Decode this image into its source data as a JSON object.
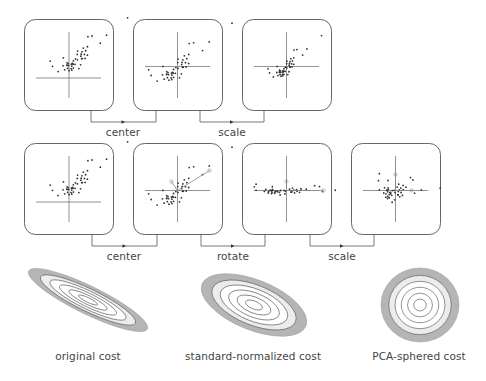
{
  "figure": {
    "rows": [
      {
        "name": "standard-normalization-pipeline",
        "panels": [
          {
            "id": "original",
            "x": 24,
            "y": 19,
            "w": 89,
            "h": 91
          },
          {
            "id": "centered",
            "x": 133,
            "y": 19,
            "w": 89,
            "h": 91
          },
          {
            "id": "scaled",
            "x": 242,
            "y": 19,
            "w": 89,
            "h": 91
          }
        ],
        "steps": [
          {
            "label": "center",
            "x1": 91,
            "x2": 156,
            "y_top": 110,
            "y": 122,
            "label_y": 127
          },
          {
            "label": "scale",
            "x1": 200,
            "x2": 264,
            "y_top": 110,
            "y": 122,
            "label_y": 127
          }
        ]
      },
      {
        "name": "pca-sphering-pipeline",
        "panels": [
          {
            "id": "original",
            "x": 24,
            "y": 143,
            "w": 89,
            "h": 91
          },
          {
            "id": "centered-with-principal-axes",
            "x": 133,
            "y": 143,
            "w": 89,
            "h": 91
          },
          {
            "id": "rotated",
            "x": 242,
            "y": 143,
            "w": 89,
            "h": 91
          },
          {
            "id": "sphered",
            "x": 351,
            "y": 143,
            "w": 89,
            "h": 91
          }
        ],
        "steps": [
          {
            "label": "center",
            "x1": 92,
            "x2": 157,
            "y_top": 234,
            "y": 246,
            "label_y": 251
          },
          {
            "label": "rotate",
            "x1": 201,
            "x2": 265,
            "y_top": 234,
            "y": 246,
            "label_y": 251
          },
          {
            "label": "scale",
            "x1": 310,
            "x2": 374,
            "y_top": 234,
            "y": 246,
            "label_y": 251
          }
        ]
      }
    ],
    "cost_plots": [
      {
        "label": "original cost",
        "cx": 88,
        "cy": 300,
        "rx": 66,
        "ry": 14,
        "angle": 26,
        "label_x": 88,
        "label_y": 350
      },
      {
        "label": "standard-normalized cost",
        "cx": 254,
        "cy": 305,
        "rx": 56,
        "ry": 25,
        "angle": 22,
        "label_x": 254,
        "label_y": 350
      },
      {
        "label": "PCA-sphered cost",
        "cx": 420,
        "cy": 305,
        "rx": 39,
        "ry": 37,
        "angle": 0,
        "label_x": 420,
        "label_y": 350
      }
    ],
    "colors": {
      "panel_border": "#555555",
      "axis": "#777777",
      "dot": "#333333",
      "outer_ring": "#b5b5b5",
      "middle_ring": "#ececec",
      "contour_line": "#666666"
    }
  }
}
